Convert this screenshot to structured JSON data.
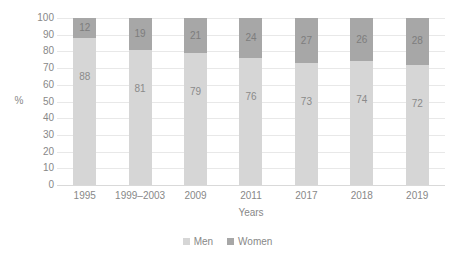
{
  "chart_data": {
    "type": "bar",
    "subtype": "stacked-100-percent",
    "title": "",
    "xlabel": "Years",
    "ylabel": "%",
    "ylim": [
      0,
      100
    ],
    "yticks": [
      100,
      90,
      80,
      70,
      60,
      50,
      40,
      30,
      20,
      10,
      0
    ],
    "grid": true,
    "legend_position": "bottom-center",
    "categories": [
      "1995",
      "1999–2003",
      "2009",
      "2011",
      "2017",
      "2018",
      "2019"
    ],
    "series": [
      {
        "name": "Men",
        "color": "#d6d6d6",
        "values": [
          88,
          81,
          79,
          76,
          73,
          74,
          72
        ]
      },
      {
        "name": "Women",
        "color": "#a7a7a7",
        "values": [
          12,
          19,
          21,
          24,
          27,
          26,
          28
        ]
      }
    ],
    "stack_order": [
      "Men",
      "Women"
    ]
  },
  "axes": {
    "y_title": "%",
    "x_title": "Years",
    "y_tick_labels": [
      "100",
      "90",
      "80",
      "70",
      "60",
      "50",
      "40",
      "30",
      "20",
      "10",
      "0"
    ],
    "x_tick_labels": [
      "1995",
      "1999–2003",
      "2009",
      "2011",
      "2017",
      "2018",
      "2019"
    ]
  },
  "legend": {
    "items": [
      {
        "label": "Men",
        "color": "#d6d6d6"
      },
      {
        "label": "Women",
        "color": "#a7a7a7"
      }
    ]
  },
  "bars": [
    {
      "category": "1995",
      "men": 88,
      "women": 12,
      "men_label": "88",
      "women_label": "12"
    },
    {
      "category": "1999–2003",
      "men": 81,
      "women": 19,
      "men_label": "81",
      "women_label": "19"
    },
    {
      "category": "2009",
      "men": 79,
      "women": 21,
      "men_label": "79",
      "women_label": "21"
    },
    {
      "category": "2011",
      "men": 76,
      "women": 24,
      "men_label": "76",
      "women_label": "24"
    },
    {
      "category": "2017",
      "men": 73,
      "women": 27,
      "men_label": "73",
      "women_label": "27"
    },
    {
      "category": "2018",
      "men": 74,
      "women": 26,
      "men_label": "74",
      "women_label": "26"
    },
    {
      "category": "2019",
      "men": 72,
      "women": 28,
      "men_label": "72",
      "women_label": "28"
    }
  ],
  "colors": {
    "men": "#d6d6d6",
    "women": "#a7a7a7",
    "gridline": "#e8e8e8",
    "text": "#888888",
    "background": "#ffffff"
  }
}
